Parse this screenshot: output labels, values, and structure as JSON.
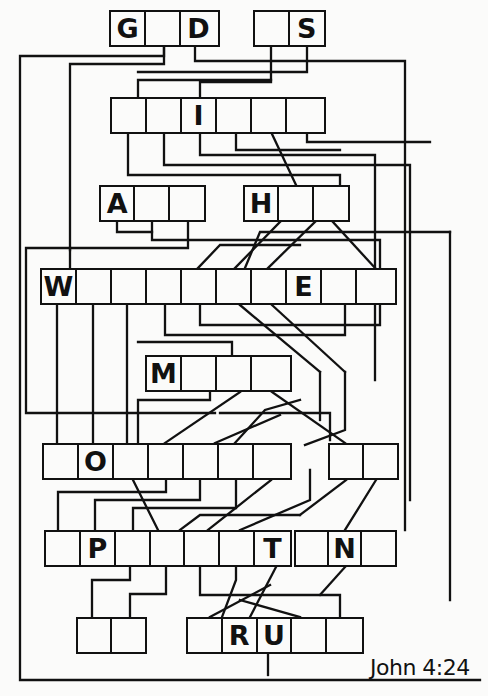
{
  "puzzle": {
    "reference": "John 4:24",
    "line_color": "#111111",
    "background": "#fbfbfa",
    "groups": [
      {
        "id": "r1a",
        "x": 109,
        "y": 10,
        "w": 111,
        "h": 37,
        "cells": [
          "G",
          "",
          "D"
        ]
      },
      {
        "id": "r1b",
        "x": 253,
        "y": 10,
        "w": 73,
        "h": 37,
        "cells": [
          "",
          "S"
        ]
      },
      {
        "id": "r2",
        "x": 110,
        "y": 97,
        "w": 216,
        "h": 37,
        "cells": [
          "",
          "",
          "I",
          "",
          "",
          ""
        ]
      },
      {
        "id": "r3a",
        "x": 99,
        "y": 185,
        "w": 107,
        "h": 37,
        "cells": [
          "A",
          "",
          ""
        ]
      },
      {
        "id": "r3b",
        "x": 243,
        "y": 185,
        "w": 107,
        "h": 37,
        "cells": [
          "H",
          "",
          ""
        ]
      },
      {
        "id": "r4",
        "x": 40,
        "y": 268,
        "w": 357,
        "h": 37,
        "cells": [
          "W",
          "",
          "",
          "",
          "",
          "",
          "",
          "E",
          "",
          ""
        ]
      },
      {
        "id": "r5",
        "x": 145,
        "y": 355,
        "w": 147,
        "h": 37,
        "cells": [
          "M",
          "",
          "",
          ""
        ]
      },
      {
        "id": "r6a",
        "x": 42,
        "y": 443,
        "w": 250,
        "h": 37,
        "cells": [
          "",
          "O",
          "",
          "",
          "",
          "",
          ""
        ]
      },
      {
        "id": "r6b",
        "x": 328,
        "y": 443,
        "w": 71,
        "h": 37,
        "cells": [
          "",
          ""
        ]
      },
      {
        "id": "r7a",
        "x": 44,
        "y": 530,
        "w": 248,
        "h": 37,
        "cells": [
          "",
          "P",
          "",
          "",
          "",
          "",
          "T"
        ]
      },
      {
        "id": "r7b",
        "x": 294,
        "y": 530,
        "w": 103,
        "h": 37,
        "cells": [
          "",
          "N",
          ""
        ]
      },
      {
        "id": "r8a",
        "x": 76,
        "y": 617,
        "w": 71,
        "h": 37,
        "cells": [
          "",
          ""
        ]
      },
      {
        "id": "r8b",
        "x": 186,
        "y": 617,
        "w": 178,
        "h": 37,
        "cells": [
          "",
          "R",
          "U",
          "",
          ""
        ]
      }
    ]
  },
  "g0": {
    "c0": "G",
    "c1": "",
    "c2": "D"
  },
  "g1": {
    "c0": "",
    "c1": "S"
  },
  "g2": {
    "c0": "",
    "c1": "",
    "c2": "I",
    "c3": "",
    "c4": "",
    "c5": ""
  },
  "g3": {
    "c0": "A",
    "c1": "",
    "c2": ""
  },
  "g4": {
    "c0": "H",
    "c1": "",
    "c2": ""
  },
  "g5": {
    "c0": "W",
    "c1": "",
    "c2": "",
    "c3": "",
    "c4": "",
    "c5": "",
    "c6": "",
    "c7": "E",
    "c8": "",
    "c9": ""
  },
  "g6": {
    "c0": "M",
    "c1": "",
    "c2": "",
    "c3": ""
  },
  "g7": {
    "c0": "",
    "c1": "O",
    "c2": "",
    "c3": "",
    "c4": "",
    "c5": "",
    "c6": ""
  },
  "g8": {
    "c0": "",
    "c1": ""
  },
  "g9": {
    "c0": "",
    "c1": "P",
    "c2": "",
    "c3": "",
    "c4": "",
    "c5": "",
    "c6": "T"
  },
  "g10": {
    "c0": "",
    "c1": "N",
    "c2": ""
  },
  "g11": {
    "c0": "",
    "c1": ""
  },
  "g12": {
    "c0": "",
    "c1": "R",
    "c2": "U",
    "c3": "",
    "c4": ""
  }
}
